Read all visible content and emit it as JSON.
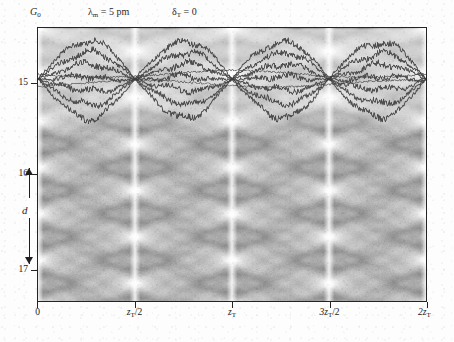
{
  "figure": {
    "annotations": {
      "g0": "G",
      "g0_sub": "0",
      "lambda_label": "λ",
      "lambda_sub": "m",
      "lambda_value": " = 5 pm",
      "delta_label": "δ",
      "delta_sub": "T",
      "delta_value": " = 0"
    },
    "y_axis": {
      "label": "d",
      "ticks": [
        {
          "value": "15",
          "pos_frac": 0.205
        },
        {
          "value": "16",
          "pos_frac": 0.535
        },
        {
          "value": "17",
          "pos_frac": 0.885
        }
      ]
    },
    "x_axis": {
      "ticks": [
        {
          "label": "0",
          "sub": "",
          "tail": "",
          "pos_frac": 0.0
        },
        {
          "label": "z",
          "sub": "T",
          "tail": "/2",
          "pos_frac": 0.25
        },
        {
          "label": "z",
          "sub": "T",
          "tail": "",
          "pos_frac": 0.5
        },
        {
          "label": "3z",
          "sub": "T",
          "tail": "/2",
          "pos_frac": 0.75
        },
        {
          "label": "2z",
          "sub": "T",
          "tail": "",
          "pos_frac": 1.0
        }
      ]
    },
    "colors": {
      "ink": "#242424",
      "trajectory": "#4a4a4a",
      "carpet_dark": "#8a8a8a",
      "carpet_light": "#ffffff",
      "paper": "#fbfbfb"
    }
  },
  "chart_data": {
    "type": "heatmap",
    "title": "",
    "subtitle": "Talbot carpet with atomic trajectories",
    "xlabel": "propagation distance z",
    "ylabel": "d",
    "xlim": [
      0,
      2
    ],
    "ylim": [
      14.6,
      17.2
    ],
    "xtick_values": [
      0,
      0.5,
      1.0,
      1.5,
      2.0
    ],
    "xtick_labels": [
      "0",
      "z_T/2",
      "z_T",
      "3z_T/2",
      "2z_T"
    ],
    "ytick_values": [
      15,
      16,
      17
    ],
    "ytick_labels": [
      "15",
      "16",
      "17"
    ],
    "grid": false,
    "legend": null,
    "parameters": {
      "lambda_m_pm": 5,
      "delta_T": 0,
      "grating": "G_0"
    },
    "carpet": {
      "description": "Talbot self-imaging interference carpet: bright white caustic rays radiate from revival foci on a mid-grey speckled background, forming a diamond lattice.",
      "period_x_frac": 0.25,
      "period_y_frac": 0.17,
      "focus_columns_frac": [
        0.0,
        0.25,
        0.5,
        0.75,
        1.0
      ],
      "intensity_min": 0.0,
      "intensity_max": 1.0
    },
    "trajectories": {
      "description": "Jagged dark classical trajectories confined to the upper band of the plot, bundling at revival nodes and spreading between them.",
      "count": 7,
      "band_y_frac": [
        0.03,
        0.33
      ],
      "node_x_frac": [
        0.0,
        0.25,
        0.5,
        0.75,
        1.0
      ]
    }
  }
}
